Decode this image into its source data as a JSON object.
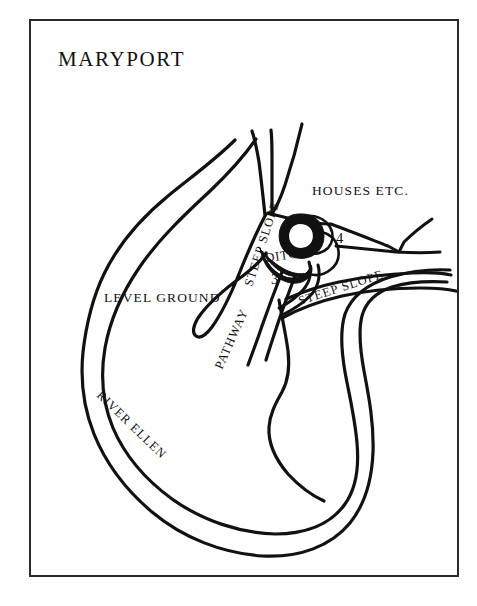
{
  "figure": {
    "title": "MARYPORT",
    "background_color": "#ffffff",
    "ink_color": "#111111",
    "frame_color": "#2b2b2b"
  },
  "labels": {
    "houses": "HOUSES ETC.",
    "level_ground": "LEVEL GROUND",
    "pathway": "PATHWAY",
    "river": "RIVER ELLEN",
    "ditch": "DITCH",
    "steep_slope_left": "STEEP SLOPE",
    "steep_slope_right": "STEEP SLOPE"
  },
  "markers": {
    "one": "1",
    "two": "2",
    "three": "3",
    "four": "4"
  },
  "icons": {
    "frame": "map-frame-icon",
    "river_band": "river-band-icon",
    "ditch_enclosure": "ditch-enclosure-icon",
    "promontory": "promontory-icon"
  }
}
